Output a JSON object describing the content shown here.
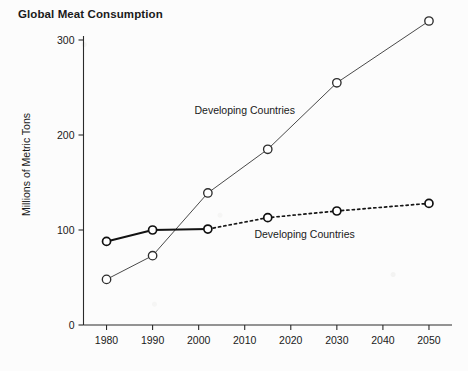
{
  "chart_data": {
    "type": "line",
    "title": "Global Meat Consumption",
    "xlabel": "",
    "ylabel": "Millions of Metric Tons",
    "xlim": [
      1975,
      2055
    ],
    "ylim": [
      0,
      300
    ],
    "grid": false,
    "legend_position": "inline-annotation",
    "x_ticks": [
      "1980",
      "1990",
      "2000",
      "2010",
      "2020",
      "2030",
      "2040",
      "2050"
    ],
    "y_ticks": [
      "0",
      "100",
      "200",
      "300"
    ],
    "series": [
      {
        "name": "Developing Countries",
        "style": "solid-thin",
        "marker": "open-circle",
        "annotation": "Developing Countries",
        "annotation_x": 2010,
        "annotation_y": 222,
        "x": [
          1980,
          1990,
          2002,
          2015,
          2030,
          2050
        ],
        "values": [
          48,
          73,
          139,
          185,
          255,
          320
        ]
      },
      {
        "name": "Developing Countries",
        "style": "solid-bold-then-dotted",
        "marker": "open-circle",
        "annotation": "Developing Countries",
        "annotation_x": 2023,
        "annotation_y": 92,
        "dotted_from": 2002,
        "x": [
          1980,
          1990,
          2002,
          2015,
          2030,
          2050
        ],
        "values": [
          88,
          100,
          101,
          113,
          120,
          128
        ]
      }
    ]
  }
}
